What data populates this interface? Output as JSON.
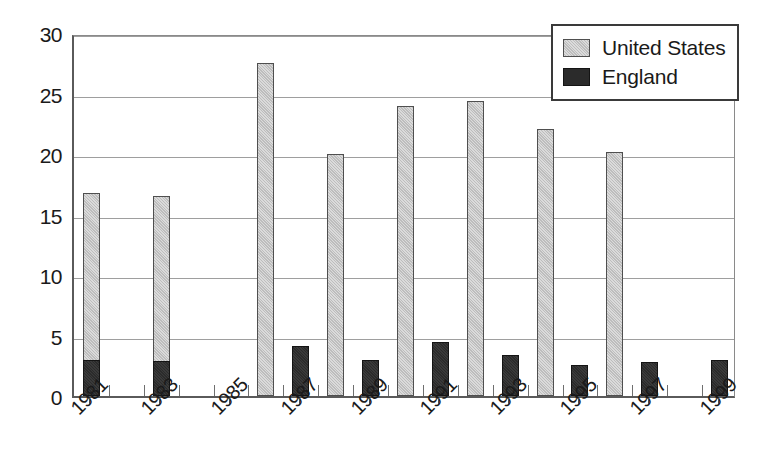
{
  "chart_data": {
    "type": "bar",
    "title": "",
    "subtitle": "",
    "xlabel": "",
    "ylabel": "",
    "ylim": [
      0,
      30
    ],
    "ytick_values": [
      0,
      5,
      10,
      15,
      20,
      25,
      30
    ],
    "ytick_labels": [
      "0",
      "5",
      "10",
      "15",
      "20",
      "25",
      "30"
    ],
    "grid": true,
    "legend_position": "top-right",
    "categories": [
      1981,
      1982,
      1983,
      1984,
      1985,
      1986,
      1987,
      1988,
      1989,
      1990,
      1991,
      1992,
      1993,
      1994,
      1995,
      1996,
      1997,
      1998,
      1999
    ],
    "xtick_labels": [
      "1981",
      "1983",
      "1985",
      "1987",
      "1989",
      "1991",
      "1993",
      "1995",
      "1997",
      "1999"
    ],
    "xtick_label_years": [
      1981,
      1983,
      1985,
      1987,
      1989,
      1991,
      1993,
      1995,
      1997,
      1999
    ],
    "series": [
      {
        "name": "United States",
        "color": "#bdbdbd",
        "points": [
          {
            "year": 1981,
            "value": 16.8
          },
          {
            "year": 1983,
            "value": 16.5
          },
          {
            "year": 1986,
            "value": 27.5
          },
          {
            "year": 1988,
            "value": 20.0
          },
          {
            "year": 1990,
            "value": 24.0
          },
          {
            "year": 1992,
            "value": 24.4
          },
          {
            "year": 1994,
            "value": 22.1
          },
          {
            "year": 1996,
            "value": 20.2
          }
        ]
      },
      {
        "name": "England",
        "color": "#2b2b2b",
        "points": [
          {
            "year": 1981,
            "value": 3.0
          },
          {
            "year": 1983,
            "value": 2.9
          },
          {
            "year": 1987,
            "value": 4.1
          },
          {
            "year": 1989,
            "value": 3.0
          },
          {
            "year": 1991,
            "value": 4.5
          },
          {
            "year": 1993,
            "value": 3.4
          },
          {
            "year": 1995,
            "value": 2.6
          },
          {
            "year": 1997,
            "value": 2.8
          },
          {
            "year": 1999,
            "value": 3.0
          }
        ]
      }
    ]
  },
  "legend": {
    "items": [
      {
        "label": "United States",
        "swatch": "us"
      },
      {
        "label": "England",
        "swatch": "eng"
      }
    ]
  }
}
